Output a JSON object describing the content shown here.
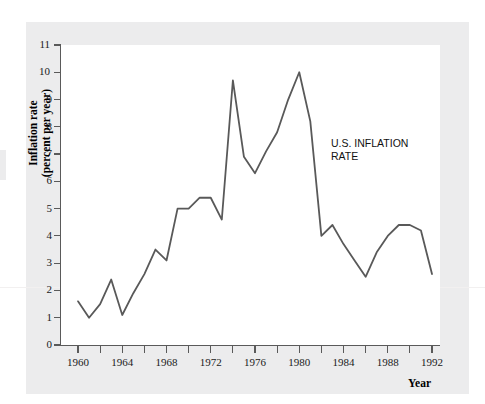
{
  "chart_data": {
    "type": "line",
    "title": "",
    "xlabel": "Year",
    "ylabel": "Inflation rate (percent per year)",
    "ylabel_line1": "Inflation rate",
    "ylabel_line2": "(percent per year)",
    "annotation": "U.S. INFLATION\nRATE",
    "grid": false,
    "legend_position": "none",
    "line_color": "#595959",
    "panel_color": "#ffffff",
    "background_color": "#ececed",
    "xlim": [
      1960,
      1992
    ],
    "ylim": [
      0,
      11
    ],
    "y_ticks": [
      0,
      1,
      2,
      3,
      4,
      5,
      6,
      7,
      8,
      9,
      10,
      11
    ],
    "y_tick_labels": [
      "0",
      "1",
      "2",
      "3",
      "4",
      "5",
      "6",
      "7",
      "8",
      "9",
      "10",
      "11"
    ],
    "x_ticks": [
      1960,
      1962,
      1964,
      1966,
      1968,
      1970,
      1972,
      1974,
      1976,
      1978,
      1980,
      1982,
      1984,
      1986,
      1988,
      1990,
      1992
    ],
    "x_tick_labels": [
      "1960",
      "",
      "1964",
      "",
      "1968",
      "",
      "1972",
      "",
      "1976",
      "",
      "1980",
      "",
      "1984",
      "",
      "1988",
      "",
      "1992"
    ],
    "x_labeled_ticks": [
      1960,
      1964,
      1968,
      1972,
      1976,
      1980,
      1984,
      1988,
      1992
    ],
    "series": [
      {
        "name": "U.S. INFLATION RATE",
        "x": [
          1960,
          1961,
          1962,
          1963,
          1964,
          1965,
          1966,
          1967,
          1968,
          1969,
          1970,
          1971,
          1972,
          1973,
          1974,
          1975,
          1976,
          1977,
          1978,
          1979,
          1980,
          1981,
          1982,
          1983,
          1984,
          1985,
          1986,
          1987,
          1988,
          1989,
          1990,
          1991,
          1992
        ],
        "values": [
          1.6,
          1.0,
          1.5,
          2.4,
          1.1,
          1.9,
          2.6,
          3.5,
          3.1,
          5.0,
          5.0,
          5.4,
          5.4,
          4.6,
          9.7,
          6.9,
          6.3,
          7.1,
          7.8,
          9.0,
          10.0,
          8.2,
          4.0,
          4.4,
          3.7,
          3.1,
          2.5,
          3.4,
          4.0,
          4.4,
          4.4,
          4.2,
          2.6
        ]
      }
    ]
  }
}
